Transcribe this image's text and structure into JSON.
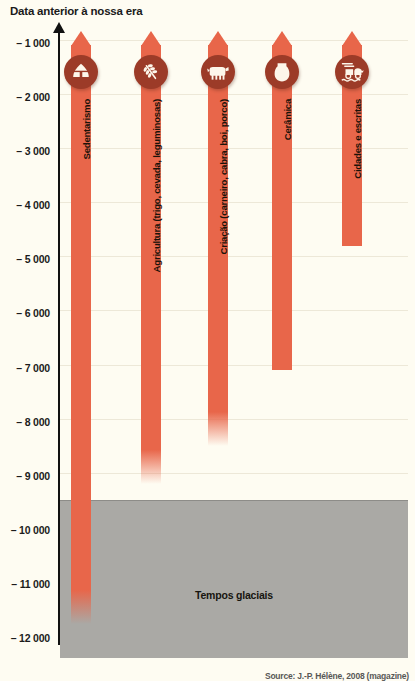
{
  "chart_data": {
    "type": "bar",
    "title": "Data anterior à nossa era",
    "xlabel": "",
    "ylabel": "Data anterior à nossa era",
    "orientation": "vertical-downward",
    "grid": true,
    "legend": "none",
    "ylim": [
      -12400,
      -650
    ],
    "y_ticks": [
      -1000,
      -2000,
      -3000,
      -4000,
      -5000,
      -6000,
      -7000,
      -8000,
      -9000,
      -10000,
      -11000,
      -12000
    ],
    "y_tick_labels": [
      "– 1 000",
      "– 2 000",
      "– 3 000",
      "– 4 000",
      "– 5 000",
      "– 6 000",
      "– 7 000",
      "– 8 000",
      "– 9 000",
      "– 10 000",
      "– 11 000",
      "– 12 000"
    ],
    "categories": [
      "Sedentarismo",
      "Agricultura (trigo, cevada, leguminosas)",
      "Criação (carneiro, cabra, boi, porco)",
      "Cerâmica",
      "Cidades e escritas"
    ],
    "series": [
      {
        "name": "Início aproximado",
        "values": [
          -11800,
          -9200,
          -8500,
          -7100,
          -4800
        ]
      }
    ],
    "annotations": [
      {
        "label": "Tempos glaciais",
        "type": "band",
        "from": -9500,
        "to": -12400,
        "color": "#aaa9a5"
      }
    ],
    "bar_color": "#e8664a",
    "icon_color": "#9c3b28",
    "background_color": "#fefcf2"
  },
  "header": {
    "title": "Data anterior à nossa era"
  },
  "axis": {
    "ticks": [
      {
        "label": "– 1 000",
        "value": -1000
      },
      {
        "label": "– 2 000",
        "value": -2000
      },
      {
        "label": "– 3 000",
        "value": -3000
      },
      {
        "label": "– 4 000",
        "value": -4000
      },
      {
        "label": "– 5 000",
        "value": -5000
      },
      {
        "label": "– 6 000",
        "value": -6000
      },
      {
        "label": "– 7 000",
        "value": -7000
      },
      {
        "label": "– 8 000",
        "value": -8000
      },
      {
        "label": "– 9 000",
        "value": -9000
      },
      {
        "label": "– 10 000",
        "value": -10000
      },
      {
        "label": "– 11 000",
        "value": -11000
      },
      {
        "label": "– 12 000",
        "value": -12000
      }
    ]
  },
  "bars": [
    {
      "label": "Sedentarismo",
      "icon": "hut-icon",
      "start": -1100,
      "end": -11800,
      "fade": true
    },
    {
      "label": "Agricultura (trigo, cevada, leguminosas)",
      "icon": "wheat-icon",
      "start": -1100,
      "end": -9200,
      "fade": true
    },
    {
      "label": "Criação (carneiro, cabra, boi, porco)",
      "icon": "livestock-icon",
      "start": -1100,
      "end": -8500,
      "fade": true
    },
    {
      "label": "Cerâmica",
      "icon": "pottery-icon",
      "start": -1100,
      "end": -7100,
      "fade": false
    },
    {
      "label": "Cidades e escritas",
      "icon": "chariot-icon",
      "start": -1100,
      "end": -4800,
      "fade": false
    }
  ],
  "glacial": {
    "label": "Tempos glaciais",
    "from": -9500,
    "to": -12400
  },
  "footer": {
    "source": "Source: J.-P. Hélène, 2008 (magazine)"
  },
  "colors": {
    "bar": "#e8664a",
    "icon_badge": "#9c3b28",
    "glacial": "#aaa9a5",
    "background": "#fefcf2",
    "axis": "#111111",
    "grid": "#ede8d8"
  }
}
